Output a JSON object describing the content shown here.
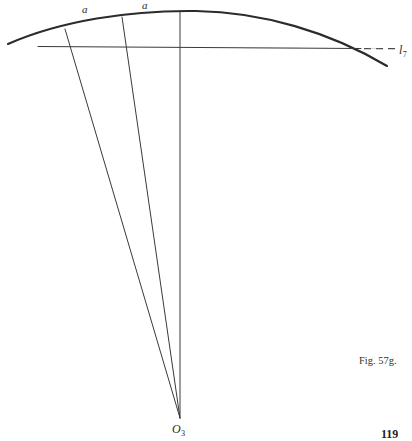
{
  "figure": {
    "caption": "Fig. 57g.",
    "page_number": "119",
    "background_color": "#ffffff",
    "ink_color": "#2b2b2b",
    "width": 412,
    "height": 441
  },
  "labels": {
    "arc_segment_1": "a",
    "arc_segment_2": "a",
    "chord_line_letter": "l",
    "chord_line_subscript": "7",
    "center_point_letter": "O",
    "center_point_subscript": "3"
  },
  "geometry": {
    "type": "technical-drawing",
    "description": "Circular arc with three radial lines converging at center point O3, a chord line labeled l7 extended by a dashed segment, and two equal arc segments labeled a.",
    "center_point": {
      "x": 180,
      "y": 418
    },
    "arc": {
      "left_end": {
        "x": 8,
        "y": 44
      },
      "apex": {
        "x": 196,
        "y": 11
      },
      "right_end": {
        "x": 387,
        "y": 66
      }
    },
    "chord": {
      "start": {
        "x": 38,
        "y": 47
      },
      "end": {
        "x": 360,
        "y": 49
      }
    },
    "dashed_extension": {
      "start": {
        "x": 362,
        "y": 48
      },
      "end": {
        "x": 395,
        "y": 48
      }
    },
    "radials": [
      {
        "name": "radial-1",
        "top": {
          "x": 65,
          "y": 29
        }
      },
      {
        "name": "radial-2",
        "top": {
          "x": 122,
          "y": 17
        }
      },
      {
        "name": "radial-3",
        "top": {
          "x": 180,
          "y": 11
        }
      }
    ]
  }
}
